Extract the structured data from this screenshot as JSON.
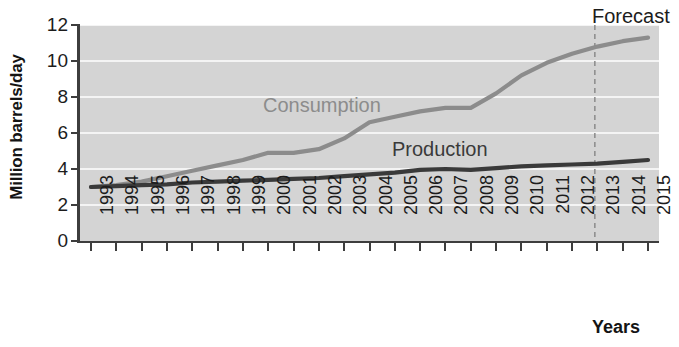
{
  "chart_data": {
    "type": "line",
    "title": "",
    "xlabel": "Years",
    "ylabel": "Million barrels/day",
    "ylim": [
      0,
      12
    ],
    "yticks": [
      0,
      2,
      4,
      6,
      8,
      10,
      12
    ],
    "grid": true,
    "legend_position": "inline-annotations",
    "x": [
      1993,
      1994,
      1995,
      1996,
      1997,
      1998,
      1999,
      2000,
      2001,
      2002,
      2003,
      2004,
      2005,
      2006,
      2007,
      2008,
      2009,
      2010,
      2011,
      2012,
      2013,
      2014,
      2015
    ],
    "categories": [
      "1993",
      "1994",
      "1995",
      "1996",
      "1997",
      "1998",
      "1999",
      "2000",
      "2001",
      "2002",
      "2003",
      "2004",
      "2005",
      "2006",
      "2007",
      "2008",
      "2009",
      "2010",
      "2011",
      "2012",
      "2013",
      "2014",
      "2015"
    ],
    "series": [
      {
        "name": "Consumption",
        "color": "#8c8c8c",
        "values": [
          3.0,
          3.1,
          3.3,
          3.6,
          3.9,
          4.2,
          4.5,
          4.9,
          4.9,
          5.1,
          5.7,
          6.6,
          6.9,
          7.2,
          7.4,
          7.4,
          8.2,
          9.2,
          9.9,
          10.4,
          10.8,
          11.1,
          11.3
        ]
      },
      {
        "name": "Production",
        "color": "#3a3a3a",
        "values": [
          3.0,
          3.05,
          3.1,
          3.15,
          3.25,
          3.3,
          3.35,
          3.4,
          3.45,
          3.5,
          3.6,
          3.7,
          3.8,
          3.95,
          4.0,
          3.95,
          4.05,
          4.15,
          4.2,
          4.25,
          4.3,
          4.4,
          4.5
        ]
      }
    ],
    "annotations": [
      {
        "name": "Forecast",
        "label": "Forecast",
        "x_value": 2012.9,
        "style": "dashed-vertical-divider"
      }
    ]
  },
  "axes": {
    "y_title": "Million barrels/day",
    "x_title": "Years",
    "y_tick_labels": [
      "12",
      "10",
      "8",
      "6",
      "4",
      "2",
      "0"
    ],
    "x_tick_labels": [
      "1993",
      "1994",
      "1995",
      "1996",
      "1997",
      "1998",
      "1999",
      "2000",
      "2001",
      "2002",
      "2003",
      "2004",
      "2005",
      "2006",
      "2007",
      "2008",
      "2009",
      "2010",
      "2011",
      "2012",
      "2013",
      "2014",
      "2015"
    ]
  },
  "labels": {
    "consumption": "Consumption",
    "production": "Production",
    "forecast": "Forecast"
  },
  "colors": {
    "plot_background": "#d4d4d4",
    "gridline": "#f4f4f4",
    "axis": "#3d3d3d",
    "consumption_line": "#8c8c8c",
    "production_line": "#3a3a3a",
    "forecast_divider": "#8f8f8f",
    "page_background": "#ffffff"
  }
}
